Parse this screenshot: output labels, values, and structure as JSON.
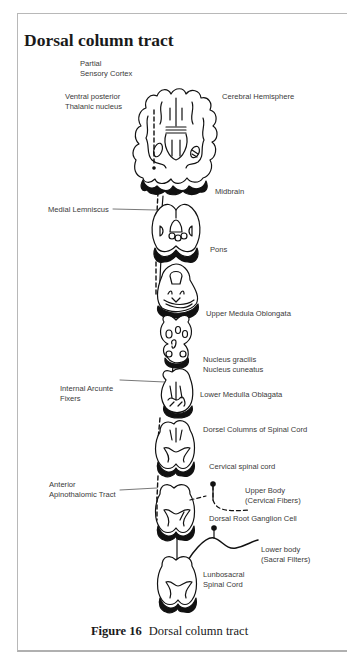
{
  "figure": {
    "title": "Dorsal column tract",
    "caption": {
      "number": "Figure 16",
      "text": "Dorsal column tract"
    }
  },
  "labels": {
    "partial_sensory_cortex": [
      "Partial",
      "Sensory Cortex"
    ],
    "ventral_posterior": [
      "Ventral posterior",
      "Thalanic nucleus"
    ],
    "cerebral_hemisphere": "Cerebral Hemisphere",
    "midbrain": "Midbrain",
    "medial_lemniscus": "Medial Lemniscus",
    "pons": "Pons",
    "upper_medulla": "Upper Medula Oblongata",
    "nucleus": [
      "Nucleus gracilis",
      "Nucleus cuneatus"
    ],
    "internal_arcuate": [
      "Internal Arcunte",
      "Fixers"
    ],
    "lower_medulla": "Lower Medulla Oblagata",
    "dorsal_columns": "Dorsel Columns of Spinal Cord",
    "cervical_spinal_cord": "Cervical spinal cord",
    "anterior_spinothalamic": [
      "Anterior",
      "Apinothalomic Tract"
    ],
    "upper_body": [
      "Upper Body",
      "(Cervical Fibers)"
    ],
    "dorsal_root_ganglion": "Dorsal Root Ganglion Cell",
    "lower_body": [
      "Lower body",
      "(Sacral Filters)"
    ],
    "lumbosacral": [
      "Lunbosacral",
      "Spinal Cord"
    ]
  },
  "colors": {
    "ink": "#111111",
    "frame": "#b8b8b8",
    "label_text": "#3a3a3a"
  }
}
